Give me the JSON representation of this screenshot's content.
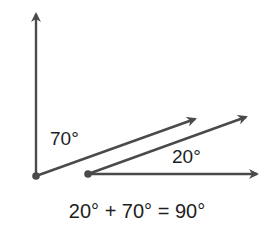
{
  "diagram": {
    "colors": {
      "line": "#4a4a4a",
      "text": "#1e1e1e",
      "background": "#ffffff"
    },
    "angles": [
      {
        "id": "angle-a",
        "label": "70°",
        "value": 70
      },
      {
        "id": "angle-b",
        "label": "20°",
        "value": 20
      }
    ],
    "equation": "20° + 70° = 90°",
    "rays": [
      {
        "id": "vertical-ray",
        "from": [
          36,
          176
        ],
        "to": [
          36,
          11
        ]
      },
      {
        "id": "ray-70",
        "from": [
          36,
          176
        ],
        "to": [
          198,
          118
        ]
      },
      {
        "id": "ray-20-upper",
        "from": [
          88,
          174
        ],
        "to": [
          249,
          116
        ]
      },
      {
        "id": "horizontal-ray",
        "from": [
          88,
          174
        ],
        "to": [
          260,
          174
        ]
      }
    ],
    "vertices": [
      {
        "id": "vertex-a",
        "at": [
          36,
          176
        ]
      },
      {
        "id": "vertex-b",
        "at": [
          88,
          174
        ]
      }
    ]
  }
}
